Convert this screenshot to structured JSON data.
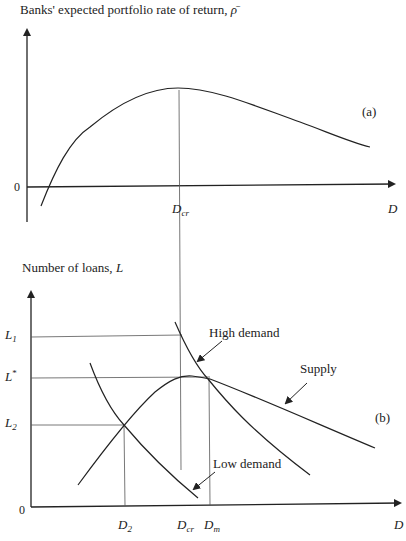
{
  "panel_a": {
    "y_axis_label": "Banks' expected portfolio rate of return, ",
    "y_axis_symbol": "ρ̄",
    "panel_label": "(a)",
    "origin_label": "0",
    "x_axis_label": "D",
    "x_tick_main": "D",
    "x_tick_sub": "cr",
    "curve": "Expected return vs D, hump-shaped, peaking at D_cr"
  },
  "panel_b": {
    "y_axis_label_text": "Number of loans, ",
    "y_axis_symbol": "L",
    "panel_label": "(b)",
    "origin_label": "0",
    "x_axis_label": "D",
    "y_ticks": [
      {
        "main": "L",
        "sub": "1",
        "sup": ""
      },
      {
        "main": "L",
        "sub": "",
        "sup": "*"
      },
      {
        "main": "L",
        "sub": "2",
        "sup": ""
      }
    ],
    "x_ticks": [
      {
        "main": "D",
        "sub": "2"
      },
      {
        "main": "D",
        "sub": "cr"
      },
      {
        "main": "D",
        "sub": "m"
      }
    ],
    "curve_labels": {
      "high_demand": "High demand",
      "supply": "Supply",
      "low_demand": "Low demand"
    }
  },
  "colors": {
    "line": "#222222",
    "guide": "#555555",
    "background": "#ffffff"
  }
}
